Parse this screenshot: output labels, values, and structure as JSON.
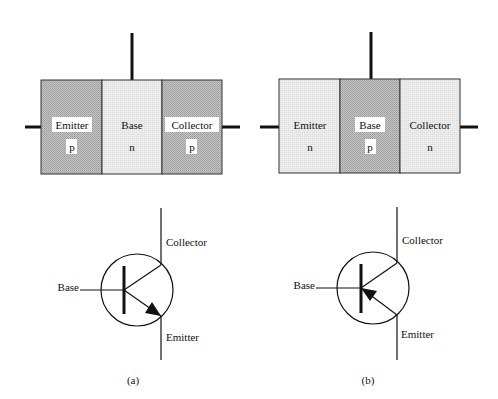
{
  "figure": {
    "panels": [
      {
        "id": "a",
        "caption": "(a)",
        "type": "pnp",
        "regions": [
          {
            "name": "Emitter",
            "doping": "p",
            "shade": "dark"
          },
          {
            "name": "Base",
            "doping": "n",
            "shade": "light"
          },
          {
            "name": "Collector",
            "doping": "p",
            "shade": "dark"
          }
        ],
        "symbol": {
          "base_label": "Base",
          "collector_label": "Collector",
          "emitter_label": "Emitter",
          "arrow_direction": "outward"
        }
      },
      {
        "id": "b",
        "caption": "(b)",
        "type": "npn",
        "regions": [
          {
            "name": "Emitter",
            "doping": "n",
            "shade": "light"
          },
          {
            "name": "Base",
            "doping": "p",
            "shade": "dark"
          },
          {
            "name": "Collector",
            "doping": "n",
            "shade": "light"
          }
        ],
        "symbol": {
          "base_label": "Base",
          "collector_label": "Collector",
          "emitter_label": "Emitter",
          "arrow_direction": "inward"
        }
      }
    ],
    "colors": {
      "dark_fill": "#b9b9b9",
      "light_fill": "#e9e9e9",
      "line": "#111111",
      "label_bg": "#ffffff"
    }
  }
}
